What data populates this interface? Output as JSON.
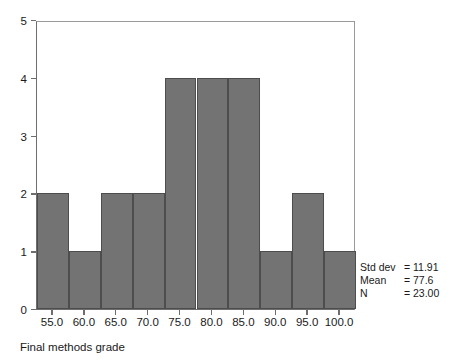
{
  "chart_data": {
    "type": "bar",
    "title": "",
    "subtitle": "",
    "xlabel": "Final methods grade",
    "ylabel": "",
    "categories": [
      "55.0",
      "60.0",
      "65.0",
      "70.0",
      "75.0",
      "80.0",
      "85.0",
      "90.0",
      "95.0",
      "100.0"
    ],
    "values": [
      2,
      1,
      2,
      2,
      4,
      4,
      4,
      1,
      2,
      1
    ],
    "x_tick_labels": [
      "55.0",
      "60.0",
      "65.0",
      "70.0",
      "75.0",
      "80.0",
      "85.0",
      "90.0",
      "95.0",
      "100.0"
    ],
    "y_tick_labels": [
      "0",
      "1",
      "2",
      "3",
      "4",
      "5"
    ],
    "y_tick_values": [
      0,
      1,
      2,
      3,
      4,
      5
    ],
    "xlim": [
      52.5,
      107.5
    ],
    "ylim": [
      0,
      5
    ],
    "bin_width": 5,
    "grid": false,
    "legend_position": "right-bottom",
    "bar_color": "#737373",
    "bar_edge_color": "#4d4d4d",
    "axis_color": "#6e6e6e",
    "background_color": "#ffffff",
    "annotations": [
      {
        "name": "Std dev",
        "eq": "=",
        "value": "11.91"
      },
      {
        "name": "Mean",
        "eq": "=",
        "value": "77.6"
      },
      {
        "name": "N",
        "eq": "=",
        "value": "23.00"
      }
    ]
  }
}
